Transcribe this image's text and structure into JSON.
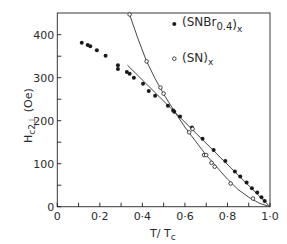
{
  "chart_data": {
    "type": "scatter",
    "title": "",
    "xlabel": "T / Tc",
    "xlabel_main": "T/ T",
    "xlabel_sub": "c",
    "ylabel": "Hc2⊥ (Oe)",
    "ylabel_main": "H",
    "ylabel_sub": "c2⊥",
    "ylabel_unit": "(Oe)",
    "xlim": [
      0,
      1.0
    ],
    "ylim": [
      0,
      450
    ],
    "x_ticks": [
      0,
      0.1,
      0.2,
      0.3,
      0.4,
      0.5,
      0.6,
      0.7,
      0.8,
      0.9,
      1.0
    ],
    "x_tick_labels": [
      "0",
      "0·2",
      "0·4",
      "0·6",
      "0·8",
      "1·0"
    ],
    "x_tick_label_values": [
      0,
      0.2,
      0.4,
      0.6,
      0.8,
      1.0
    ],
    "y_ticks": [
      0,
      50,
      100,
      150,
      200,
      250,
      300,
      350,
      400
    ],
    "y_tick_labels": [
      "0",
      "100",
      "200",
      "300",
      "400"
    ],
    "y_tick_label_values": [
      0,
      100,
      200,
      300,
      400
    ],
    "grid": false,
    "legend_position": "upper right (inside)",
    "series": [
      {
        "name": "(SNBr0.4)x",
        "label_main": "(SNBr",
        "label_sub1": "0.4",
        "label_close": ")",
        "label_sub2": "x",
        "marker": "filled-circle",
        "fit": "straight line from T/Tc≈0.33 to 1.0",
        "fit_points": [
          [
            0.33,
            329
          ],
          [
            1.0,
            0
          ]
        ],
        "points": [
          [
            0.115,
            381
          ],
          [
            0.143,
            376
          ],
          [
            0.155,
            373
          ],
          [
            0.186,
            364
          ],
          [
            0.227,
            351
          ],
          [
            0.285,
            329
          ],
          [
            0.285,
            320
          ],
          [
            0.327,
            313
          ],
          [
            0.34,
            309
          ],
          [
            0.36,
            300
          ],
          [
            0.403,
            286
          ],
          [
            0.43,
            269
          ],
          [
            0.46,
            258
          ],
          [
            0.52,
            235
          ],
          [
            0.545,
            224
          ],
          [
            0.55,
            221
          ],
          [
            0.577,
            210
          ],
          [
            0.633,
            184
          ],
          [
            0.683,
            158
          ],
          [
            0.735,
            132
          ],
          [
            0.79,
            106
          ],
          [
            0.835,
            82
          ],
          [
            0.86,
            70
          ],
          [
            0.89,
            56
          ],
          [
            0.915,
            43
          ],
          [
            0.94,
            33
          ],
          [
            0.96,
            22
          ],
          [
            0.975,
            13
          ]
        ]
      },
      {
        "name": "(SN)x",
        "label_main": "(SN)",
        "label_sub2": "x",
        "marker": "open-circle",
        "fit": "curve",
        "fit_points": [
          [
            0.34,
            447
          ],
          [
            0.38,
            390
          ],
          [
            0.42,
            338
          ],
          [
            0.46,
            298
          ],
          [
            0.5,
            262
          ],
          [
            0.55,
            222
          ],
          [
            0.6,
            185
          ],
          [
            0.65,
            152
          ],
          [
            0.7,
            120
          ],
          [
            0.75,
            92
          ],
          [
            0.8,
            64
          ],
          [
            0.85,
            40
          ],
          [
            0.9,
            22
          ],
          [
            0.95,
            8
          ],
          [
            1.0,
            0
          ]
        ],
        "points": [
          [
            0.34,
            447
          ],
          [
            0.42,
            338
          ],
          [
            0.485,
            277
          ],
          [
            0.5,
            263
          ],
          [
            0.62,
            173
          ],
          [
            0.636,
            181
          ],
          [
            0.69,
            120
          ],
          [
            0.7,
            120
          ],
          [
            0.725,
            102
          ],
          [
            0.74,
            93
          ],
          [
            0.815,
            54
          ],
          [
            0.92,
            19
          ]
        ]
      }
    ]
  },
  "layout": {
    "plot_left": 57.3,
    "plot_right": 270,
    "plot_top": 13,
    "plot_bottom": 206.7,
    "y_px_per_unit": 0.43
  }
}
